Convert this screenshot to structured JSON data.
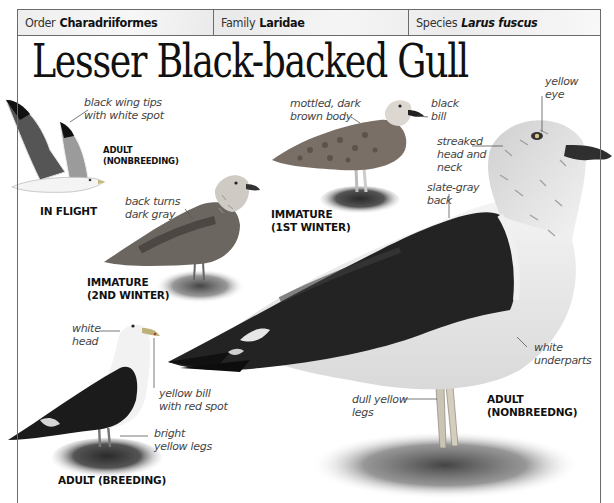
{
  "taxonomy": {
    "order": {
      "label": "Order",
      "value": "Charadriiformes"
    },
    "family": {
      "label": "Family",
      "value": "Laridae"
    },
    "species": {
      "label": "Species",
      "value": "Larus fuscus"
    }
  },
  "title": "Lesser Black-backed Gull",
  "illustrations": {
    "in_flight": {
      "caption": "IN FLIGHT",
      "sub_caption": "ADULT\n(NONBREEDING)",
      "notes": [
        "black wing tips\nwith white spot"
      ]
    },
    "immature_2nd_winter": {
      "caption": "IMMATURE\n(2ND WINTER)",
      "notes": [
        "back turns\ndark gray"
      ]
    },
    "immature_1st_winter": {
      "caption": "IMMATURE\n(1ST WINTER)",
      "notes": [
        "mottled, dark\nbrown body",
        "black\nbill"
      ]
    },
    "adult_nonbreeding": {
      "caption": "ADULT\n(NONBREEDNG)",
      "notes": [
        "yellow\neye",
        "streaked\nhead and\nneck",
        "slate-gray\nback",
        "white\nunderparts",
        "dull yellow\nlegs"
      ]
    },
    "adult_breeding": {
      "caption": "ADULT (BREEDING)",
      "notes": [
        "white\nhead",
        "yellow bill\nwith red spot",
        "bright\nyellow legs"
      ]
    }
  },
  "colors": {
    "frame": "#6b6b6b",
    "header_bg": "#efefef",
    "text": "#111111",
    "note_text": "#444444"
  }
}
